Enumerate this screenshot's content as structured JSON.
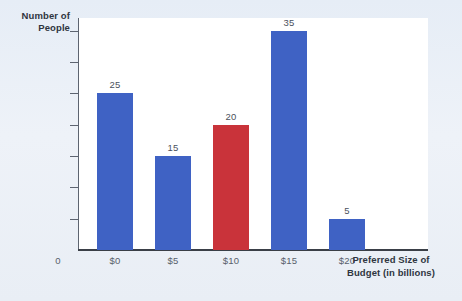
{
  "chart_data": {
    "type": "bar",
    "title": "",
    "xlabel": "Preferred Size of Budget (in billions)",
    "xlabel_line1": "Preferred Size of",
    "xlabel_line2": "Budget (in billions)",
    "ylabel": "Number of People",
    "ylabel_line1": "Number of",
    "ylabel_line2": "People",
    "categories": [
      "$0",
      "$5",
      "$10",
      "$15",
      "$20"
    ],
    "values": [
      25,
      15,
      20,
      35,
      5
    ],
    "value_labels": [
      "25",
      "15",
      "20",
      "35",
      "5"
    ],
    "bar_colors": [
      "#3f62c4",
      "#3f62c4",
      "#c9333a",
      "#3f62c4",
      "#3f62c4"
    ],
    "highlight_category": "$10",
    "ylim": [
      0,
      37
    ],
    "yticks": [
      0,
      5,
      10,
      15,
      20,
      25,
      30,
      35
    ],
    "ytick_labels": [
      "0",
      "5",
      "10",
      "15",
      "20",
      "25",
      "30",
      "35"
    ],
    "origin_label": "0",
    "grid": false,
    "legend": "none"
  },
  "colors": {
    "series_blue": "#3f62c4",
    "series_red": "#c9333a",
    "page_background": "#e9eff6",
    "plot_background": "#ffffff",
    "axis": "#3a3f47",
    "tick_text": "#585f6b",
    "title_text": "#2f3540"
  }
}
